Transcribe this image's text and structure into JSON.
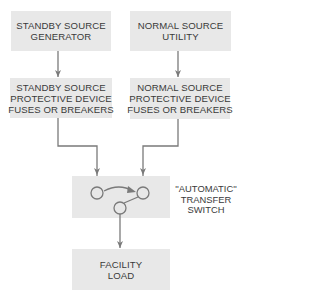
{
  "diagram": {
    "title": "",
    "colors": {
      "box_fill": "#e8e8e8",
      "line": "#7a7a7a",
      "text": "#3a3a3a"
    },
    "nodes": {
      "standby_source": {
        "lines": [
          "STANDBY SOURCE",
          "GENERATOR"
        ]
      },
      "normal_source": {
        "lines": [
          "NORMAL SOURCE",
          "UTILITY"
        ]
      },
      "standby_protective": {
        "lines": [
          "STANDBY SOURCE",
          "PROTECTIVE DEVICE",
          "FUSES OR BREAKERS"
        ]
      },
      "normal_protective": {
        "lines": [
          "NORMAL SOURCE",
          "PROTECTIVE DEVICE",
          "FUSES OR BREAKERS"
        ]
      },
      "transfer_switch": {
        "lines": [
          "''AUTOMATIC''",
          "TRANSFER",
          "SWITCH"
        ]
      },
      "facility_load": {
        "lines": [
          "FACILITY",
          "LOAD"
        ]
      }
    },
    "edges": [
      {
        "from": "standby_source",
        "to": "standby_protective"
      },
      {
        "from": "normal_source",
        "to": "normal_protective"
      },
      {
        "from": "standby_protective",
        "to": "transfer_switch"
      },
      {
        "from": "normal_protective",
        "to": "transfer_switch"
      },
      {
        "from": "transfer_switch",
        "to": "facility_load"
      }
    ]
  }
}
